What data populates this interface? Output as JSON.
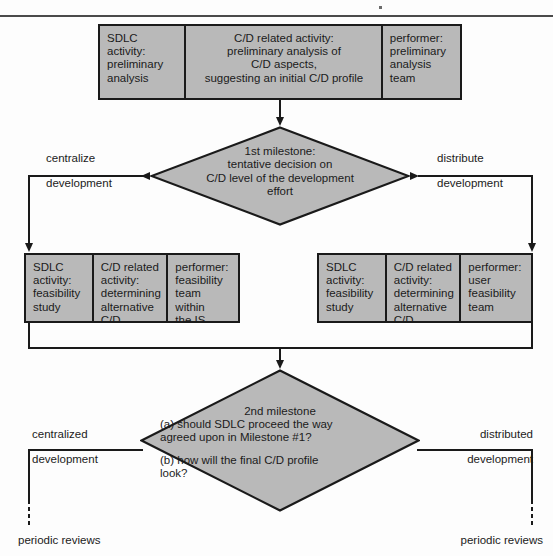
{
  "diagram": {
    "title_rule": "horizontal-rule",
    "colors": {
      "fill": "#b9b9b9",
      "stroke": "#1a1a1a",
      "text": "#1b1b1b",
      "background": "#fdfdfd"
    }
  },
  "row_top": {
    "sdlc": "SDLC\nactivity:\npreliminary\nanalysis",
    "cd": "C/D related activity:\npreliminary analysis of\nC/D aspects,\nsuggesting an initial C/D profile",
    "performer": "performer:\npreliminary\nanalysis\nteam"
  },
  "milestone1": {
    "text": "1st milestone:\ntentative decision on\nC/D level of the development\neffort",
    "left_label_line1": "centralize",
    "left_label_line2": "development",
    "right_label_line1": "distribute",
    "right_label_line2": "development"
  },
  "row_left": {
    "sdlc": "SDLC\nactivity:\nfeasibility\nstudy",
    "cd": "C/D related\nactivity:\ndetermining\nalternative\nC/D profiles",
    "performer": "performer:\nfeasibility\nteam within\nthe IS\nfunction"
  },
  "row_right": {
    "sdlc": "SDLC\nactivity:\nfeasibility\nstudy",
    "cd": "C/D related\nactivity:\ndetermining\nalternative\nC/D profiles",
    "performer": "performer:\nuser\nfeasibility\nteam"
  },
  "milestone2": {
    "heading": "2nd milestone",
    "question_a": "(a) should SDLC proceed the way\n      agreed upon in Milestone #1?",
    "question_b": "(b) how will the final C/D profile\n      look?",
    "left_label_line1": "centralized",
    "left_label_line2": "development",
    "right_label_line1": "distributed",
    "right_label_line2": "development"
  },
  "outcomes": {
    "left": "periodic reviews",
    "right": "periodic reviews"
  }
}
